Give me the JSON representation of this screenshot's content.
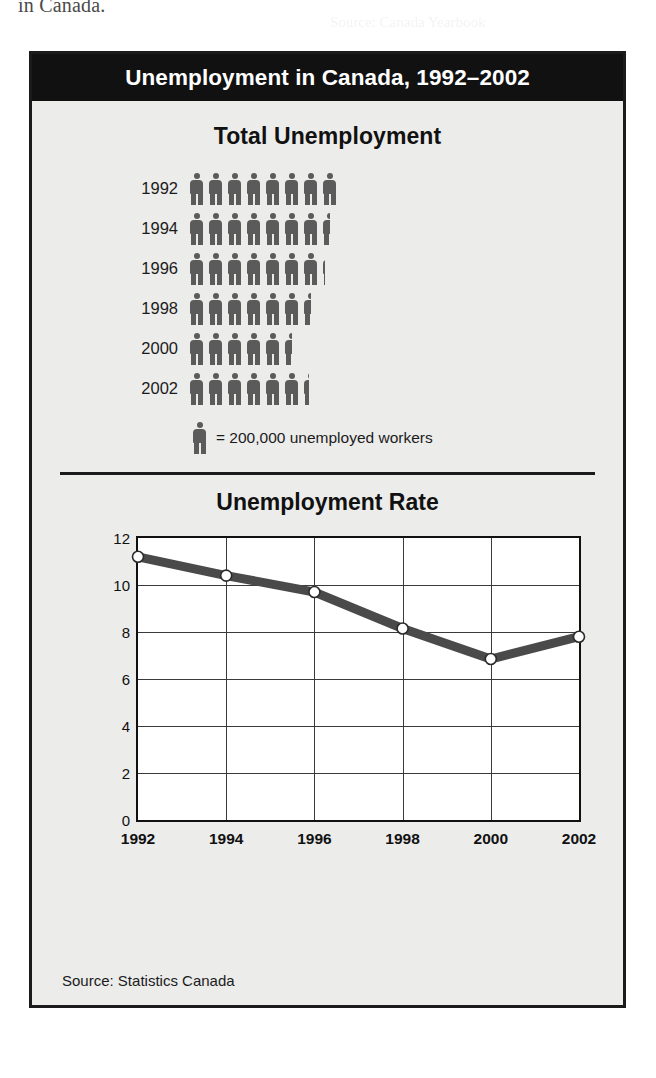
{
  "page": {
    "bleed_text_top": "in Canada."
  },
  "figure": {
    "banner_title": "Unemployment in Canada, 1992–2002",
    "source": "Source: Statistics Canada",
    "colors": {
      "banner_background": "#111111",
      "figure_background": "#ececeb",
      "frame_border": "#1b1b1b",
      "pictograph_figure": "#5b5b5b",
      "line_series": "#4a4a4a",
      "plot_background": "#ffffff",
      "grid": "#3a3a3a"
    }
  },
  "chart_data": [
    {
      "type": "bar",
      "subtype": "pictograph",
      "title": "Total Unemployment",
      "xlabel": "",
      "ylabel": "",
      "unit_label": "= 200,000 unemployed workers",
      "unit_value": 200000,
      "icon": "person-icon",
      "categories": [
        "1992",
        "1994",
        "1996",
        "1998",
        "2000",
        "2002"
      ],
      "values": [
        1600000,
        1500000,
        1450000,
        1300000,
        1100000,
        1280000
      ],
      "icon_counts": [
        8,
        7.5,
        7.2,
        6.5,
        5.5,
        6.4
      ],
      "legend": "off",
      "grid": "off"
    },
    {
      "type": "line",
      "title": "Unemployment Rate",
      "xlabel": "",
      "ylabel": "Percent of Labor Force",
      "x": [
        "1992",
        "1994",
        "1996",
        "1998",
        "2000",
        "2002"
      ],
      "values": [
        11.2,
        10.4,
        9.7,
        8.15,
        6.85,
        7.8
      ],
      "yticks": [
        0,
        2,
        4,
        6,
        8,
        10,
        12
      ],
      "ylim": [
        0,
        12
      ],
      "grid": "on",
      "legend": "off",
      "markers": "open-circle"
    }
  ]
}
